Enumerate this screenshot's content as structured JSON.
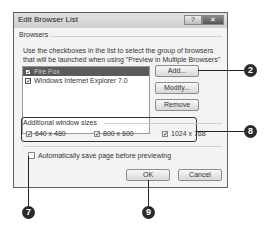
{
  "window": {
    "title": "Edit Browser List",
    "help_glyph": "?",
    "close_glyph": "✕"
  },
  "browsers_group": {
    "label": "Browsers",
    "description": "Use the checkboxes in the list to select the group of browsers that will be launched when using \"Preview in Multiple Browsers\"",
    "items": [
      {
        "label": "Fire Fox",
        "checked": true,
        "selected": true
      },
      {
        "label": "Windows Internet Explorer 7.0",
        "checked": true,
        "selected": false
      }
    ],
    "buttons": {
      "add": "Add...",
      "modify": "Modify...",
      "remove": "Remove"
    }
  },
  "window_sizes_group": {
    "label": "Additional window sizes",
    "options": [
      {
        "label": "640 x 480",
        "checked": true
      },
      {
        "label": "800 x 600",
        "checked": true
      },
      {
        "label": "1024 x 768",
        "checked": true
      }
    ]
  },
  "auto_save": {
    "label": "Automatically save page before previewing",
    "checked": false
  },
  "footer": {
    "ok": "OK",
    "cancel": "Cancel"
  },
  "callouts": {
    "c2": "2",
    "c8": "8",
    "c7": "7",
    "c9": "9"
  },
  "check_glyph": "✓"
}
